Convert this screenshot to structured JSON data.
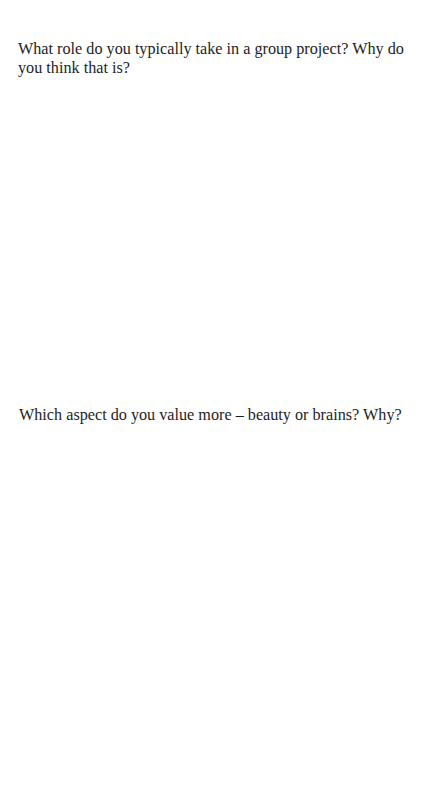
{
  "page": {
    "questions": [
      {
        "text": "What role do you typically take in a group project? Why do you think that is?"
      },
      {
        "text": "Which aspect do you value more – beauty or brains? Why?"
      }
    ]
  }
}
